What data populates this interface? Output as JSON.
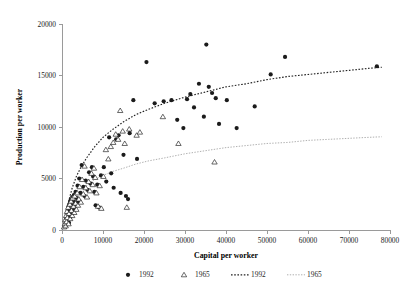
{
  "chart_data": {
    "type": "scatter",
    "title": "",
    "xlabel": "Capital per worker",
    "ylabel": "Production per worker",
    "xlim": [
      0,
      80000
    ],
    "ylim": [
      0,
      20000
    ],
    "xticks": [
      0,
      10000,
      20000,
      30000,
      40000,
      50000,
      60000,
      70000,
      80000
    ],
    "yticks": [
      0,
      5000,
      10000,
      15000,
      20000
    ],
    "xtick_labels": [
      "0",
      "10000",
      "20000",
      "30000",
      "40000",
      "50000",
      "60000",
      "70000",
      "80000"
    ],
    "ytick_labels": [
      "0",
      "5000",
      "10000",
      "15000",
      "20000"
    ],
    "grid": false,
    "legend_position": "bottom",
    "legend": [
      {
        "label": "1992",
        "marker": "filled-circle",
        "color": "#1b1b1b"
      },
      {
        "label": "1965",
        "marker": "open-triangle",
        "color": "#2a2a2a"
      },
      {
        "label": "1992",
        "marker": "dotted-line",
        "color": "#222222"
      },
      {
        "label": "1965",
        "marker": "dotted-line",
        "color": "#b0b0b0"
      }
    ],
    "series": [
      {
        "name": "1992",
        "marker": "filled-circle",
        "color": "#1b1b1b",
        "points": [
          [
            700,
            400
          ],
          [
            900,
            700
          ],
          [
            1000,
            1100
          ],
          [
            1100,
            500
          ],
          [
            1200,
            1500
          ],
          [
            1300,
            900
          ],
          [
            1400,
            1900
          ],
          [
            1500,
            1300
          ],
          [
            1600,
            2300
          ],
          [
            1700,
            700
          ],
          [
            1800,
            1700
          ],
          [
            1900,
            2600
          ],
          [
            2000,
            1200
          ],
          [
            2100,
            2900
          ],
          [
            2200,
            2000
          ],
          [
            2400,
            1500
          ],
          [
            2500,
            3200
          ],
          [
            2600,
            2400
          ],
          [
            2800,
            1800
          ],
          [
            2900,
            3400
          ],
          [
            3000,
            2700
          ],
          [
            3100,
            2100
          ],
          [
            3300,
            3700
          ],
          [
            3500,
            2500
          ],
          [
            3600,
            3100
          ],
          [
            3800,
            4300
          ],
          [
            4000,
            2800
          ],
          [
            4200,
            5000
          ],
          [
            4500,
            3600
          ],
          [
            4800,
            6300
          ],
          [
            5200,
            4200
          ],
          [
            5500,
            3300
          ],
          [
            5800,
            4800
          ],
          [
            6200,
            3900
          ],
          [
            6600,
            5600
          ],
          [
            7000,
            4500
          ],
          [
            7300,
            6100
          ],
          [
            7600,
            5200
          ],
          [
            7900,
            3700
          ],
          [
            8200,
            2400
          ],
          [
            8600,
            4400
          ],
          [
            9000,
            2200
          ],
          [
            9500,
            5300
          ],
          [
            10200,
            6100
          ],
          [
            10800,
            4700
          ],
          [
            11500,
            9000
          ],
          [
            12000,
            5500
          ],
          [
            12600,
            4100
          ],
          [
            13200,
            8800
          ],
          [
            13800,
            9200
          ],
          [
            14300,
            3600
          ],
          [
            15000,
            7300
          ],
          [
            15600,
            3300
          ],
          [
            16100,
            3000
          ],
          [
            16500,
            9400
          ],
          [
            17400,
            12600
          ],
          [
            18300,
            6900
          ],
          [
            20600,
            16300
          ],
          [
            22600,
            12300
          ],
          [
            24800,
            12500
          ],
          [
            26700,
            12600
          ],
          [
            28100,
            10700
          ],
          [
            29600,
            9900
          ],
          [
            30500,
            12700
          ],
          [
            31300,
            13200
          ],
          [
            32200,
            11900
          ],
          [
            33400,
            14200
          ],
          [
            34600,
            11000
          ],
          [
            35200,
            18000
          ],
          [
            35800,
            13900
          ],
          [
            36600,
            13300
          ],
          [
            37500,
            12800
          ],
          [
            38300,
            10300
          ],
          [
            40200,
            12600
          ],
          [
            42600,
            9900
          ],
          [
            47000,
            12000
          ],
          [
            50900,
            15100
          ],
          [
            54400,
            16800
          ],
          [
            76800,
            15900
          ]
        ]
      },
      {
        "name": "1965",
        "marker": "open-triangle",
        "color": "#2a2a2a",
        "points": [
          [
            500,
            300
          ],
          [
            700,
            600
          ],
          [
            800,
            1000
          ],
          [
            900,
            400
          ],
          [
            1000,
            1400
          ],
          [
            1100,
            800
          ],
          [
            1200,
            1800
          ],
          [
            1300,
            1200
          ],
          [
            1500,
            2200
          ],
          [
            1600,
            600
          ],
          [
            1700,
            1600
          ],
          [
            1900,
            2500
          ],
          [
            2000,
            1100
          ],
          [
            2200,
            2800
          ],
          [
            2300,
            1900
          ],
          [
            2500,
            1400
          ],
          [
            2600,
            3100
          ],
          [
            2800,
            2300
          ],
          [
            3000,
            1700
          ],
          [
            3100,
            3300
          ],
          [
            3300,
            2600
          ],
          [
            3500,
            2000
          ],
          [
            3700,
            3600
          ],
          [
            3900,
            2400
          ],
          [
            4100,
            3000
          ],
          [
            4300,
            4200
          ],
          [
            4600,
            2700
          ],
          [
            4900,
            4900
          ],
          [
            5200,
            3500
          ],
          [
            5500,
            6200
          ],
          [
            5800,
            4100
          ],
          [
            6100,
            3200
          ],
          [
            6500,
            4700
          ],
          [
            6800,
            3800
          ],
          [
            7200,
            5500
          ],
          [
            7500,
            4400
          ],
          [
            7800,
            6000
          ],
          [
            8100,
            5100
          ],
          [
            8400,
            3600
          ],
          [
            8800,
            2300
          ],
          [
            9200,
            4300
          ],
          [
            9600,
            2100
          ],
          [
            10100,
            5200
          ],
          [
            10700,
            7800
          ],
          [
            11300,
            6900
          ],
          [
            11900,
            8100
          ],
          [
            12500,
            8500
          ],
          [
            13100,
            9300
          ],
          [
            13700,
            8800
          ],
          [
            14200,
            11600
          ],
          [
            14800,
            9600
          ],
          [
            15300,
            8400
          ],
          [
            15800,
            2200
          ],
          [
            16400,
            9800
          ],
          [
            18200,
            9200
          ],
          [
            19000,
            9500
          ],
          [
            24600,
            11000
          ],
          [
            28400,
            8400
          ],
          [
            37200,
            6600
          ]
        ]
      }
    ],
    "trend_lines": [
      {
        "name": "1992",
        "style": "dotted",
        "color": "#222222",
        "points": [
          [
            700,
            900
          ],
          [
            1500,
            2600
          ],
          [
            2500,
            4100
          ],
          [
            3500,
            5200
          ],
          [
            4500,
            6000
          ],
          [
            6000,
            7000
          ],
          [
            8000,
            8100
          ],
          [
            10000,
            9000
          ],
          [
            12500,
            9800
          ],
          [
            15000,
            10500
          ],
          [
            18000,
            11200
          ],
          [
            21000,
            11700
          ],
          [
            25000,
            12300
          ],
          [
            30000,
            12900
          ],
          [
            35000,
            13400
          ],
          [
            40000,
            13900
          ],
          [
            45000,
            14200
          ],
          [
            50000,
            14600
          ],
          [
            55000,
            14900
          ],
          [
            60000,
            15100
          ],
          [
            65000,
            15300
          ],
          [
            70000,
            15500
          ],
          [
            75000,
            15700
          ],
          [
            78000,
            15800
          ]
        ]
      },
      {
        "name": "1965",
        "style": "dotted",
        "color": "#b0b0b0",
        "points": [
          [
            600,
            500
          ],
          [
            1500,
            1600
          ],
          [
            2500,
            2500
          ],
          [
            3500,
            3200
          ],
          [
            4500,
            3700
          ],
          [
            6000,
            4300
          ],
          [
            8000,
            4900
          ],
          [
            10000,
            5300
          ],
          [
            12500,
            5700
          ],
          [
            15000,
            6000
          ],
          [
            18000,
            6400
          ],
          [
            21000,
            6700
          ],
          [
            25000,
            7000
          ],
          [
            30000,
            7400
          ],
          [
            35000,
            7700
          ],
          [
            40000,
            8000
          ],
          [
            45000,
            8200
          ],
          [
            50000,
            8400
          ],
          [
            55000,
            8500
          ],
          [
            60000,
            8700
          ],
          [
            65000,
            8800
          ],
          [
            70000,
            8900
          ],
          [
            75000,
            9000
          ],
          [
            78000,
            9050
          ]
        ]
      }
    ]
  }
}
